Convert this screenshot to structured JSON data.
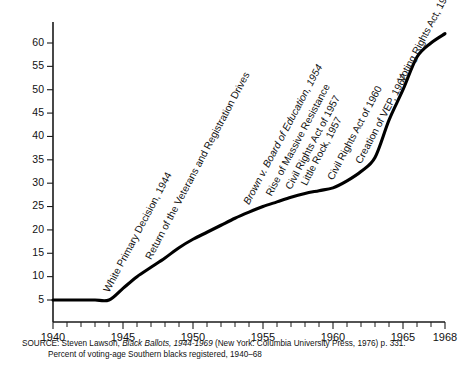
{
  "figure": {
    "subtitle": "Percent of voting-age Southern blacks registered, 1940–68",
    "source_prefix": "SOURCE:",
    "source_author": " Steven Lawson, ",
    "source_title": "Black Ballots, 1944-1969",
    "source_rest": " (New York: Columbia University Press, 1976) p. 331."
  },
  "chart_data": {
    "type": "line",
    "title": "",
    "subtitle": "Percent of voting-age Southern blacks registered, 1940–68",
    "xlabel": "",
    "ylabel": "",
    "xlim": [
      1940,
      1968
    ],
    "ylim": [
      0,
      63
    ],
    "grid": false,
    "legend": "none",
    "line_color": "#000000",
    "x_ticks": [
      1940,
      1941,
      1942,
      1943,
      1944,
      1945,
      1946,
      1947,
      1948,
      1949,
      1950,
      1951,
      1952,
      1953,
      1954,
      1955,
      1956,
      1957,
      1958,
      1959,
      1960,
      1961,
      1962,
      1963,
      1964,
      1965,
      1966,
      1967,
      1968
    ],
    "x_tick_labels": [
      "1940",
      "1945",
      "1950",
      "1955",
      "1960",
      "1965",
      "1968"
    ],
    "x_tick_label_values": [
      1940,
      1945,
      1950,
      1955,
      1960,
      1965,
      1968
    ],
    "y_ticks": [
      5,
      10,
      15,
      20,
      25,
      30,
      35,
      40,
      45,
      50,
      55,
      60
    ],
    "y_tick_labels": [
      "5",
      "10",
      "15",
      "20",
      "25",
      "30",
      "35",
      "40",
      "45",
      "50",
      "55",
      "60"
    ],
    "series": [
      {
        "name": "Percent registered",
        "x": [
          1940,
          1941,
          1942,
          1943,
          1944,
          1945,
          1946,
          1947,
          1948,
          1949,
          1950,
          1951,
          1952,
          1953,
          1954,
          1955,
          1956,
          1957,
          1958,
          1959,
          1960,
          1961,
          1962,
          1963,
          1964,
          1965,
          1966,
          1967,
          1968
        ],
        "values": [
          5,
          5,
          5,
          5,
          5,
          7.5,
          10,
          12,
          14,
          16.2,
          18,
          19.5,
          21,
          22.5,
          23.8,
          25,
          26,
          27,
          27.8,
          28.4,
          29,
          30.5,
          32.5,
          35.5,
          43.5,
          50,
          57,
          60,
          62
        ]
      }
    ],
    "annotations": [
      {
        "label": "White Primary Decision, 1944",
        "year": 1944,
        "italic": false
      },
      {
        "label": "Return of the Veterans and Registration Drives",
        "year": 1947,
        "italic": false
      },
      {
        "label": "Brown v. Board of Education, 1954",
        "year": 1954,
        "italic": true
      },
      {
        "label": "Rise of Massive Resistance",
        "year": 1955.6,
        "italic": false
      },
      {
        "label": "Civil Rights Act of 1957",
        "year": 1957,
        "italic": false
      },
      {
        "label": "Little Rock, 1957",
        "year": 1958.1,
        "italic": false
      },
      {
        "label": "Civil Rights Act of 1960",
        "year": 1960,
        "italic": false
      },
      {
        "label": "Creation of VEP, 1962",
        "year": 1962,
        "italic": false
      },
      {
        "label": "Voting Rights Act, 1965",
        "year": 1965,
        "italic": false
      }
    ]
  }
}
